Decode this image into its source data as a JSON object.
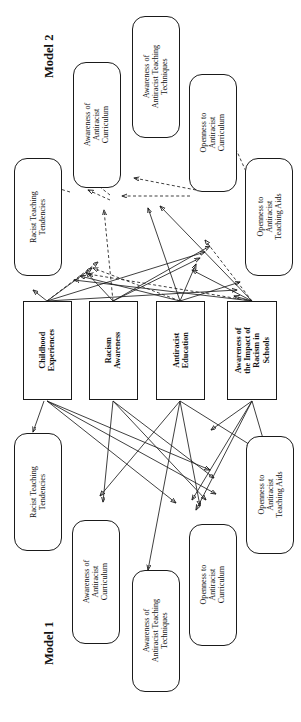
{
  "figure": {
    "type": "path-diagram",
    "orientation": "rotated-90-ccw",
    "model_titles": {
      "model2": "Model 2",
      "model1": "Model 1"
    }
  },
  "central_predictors": [
    {
      "id": "childhood",
      "label": "Childhood\nExperiences",
      "shape": "rectangle"
    },
    {
      "id": "racism_awareness",
      "label": "Racism\nAwareness",
      "shape": "rectangle"
    },
    {
      "id": "antiracist_education",
      "label": "Antiracist\nEducation",
      "shape": "rectangle"
    },
    {
      "id": "impact_awareness",
      "label": "Awareness of\nthe Impact of\nRacism in\nSchools",
      "shape": "rectangle"
    }
  ],
  "model2_nodes": [
    {
      "id": "m2_racist_tend",
      "label": "Racist Teaching\nTendencies",
      "shape": "rounded"
    },
    {
      "id": "m2_aware_curric",
      "label": "Awareness of\nAntiracist\nCurriculum",
      "shape": "rounded"
    },
    {
      "id": "m2_aware_tech",
      "label": "Awareness of\nAntiracist Teaching\nTechniques",
      "shape": "rounded"
    },
    {
      "id": "m2_open_curric",
      "label": "Openness to\nAntiracist\nCurriculum",
      "shape": "rounded"
    },
    {
      "id": "m2_open_aids",
      "label": "Openness to\nAntiracist\nTeaching Aids",
      "shape": "rounded"
    }
  ],
  "model1_nodes": [
    {
      "id": "m1_racist_tend",
      "label": "Racist Teaching\nTendencies",
      "shape": "rounded"
    },
    {
      "id": "m1_aware_curric",
      "label": "Awareness of\nAntiracist\nCurriculum",
      "shape": "rounded"
    },
    {
      "id": "m1_aware_tech",
      "label": "Awareness of\nAntiracist Teaching\nTechniques",
      "shape": "rounded"
    },
    {
      "id": "m1_open_curric",
      "label": "Openness to\nAntiracist\nCurriculum",
      "shape": "rounded"
    },
    {
      "id": "m1_open_aids",
      "label": "Openness to\nAntiracist\nTeaching Aids",
      "shape": "rounded"
    }
  ],
  "edge_styles": {
    "solid": "direct path",
    "dashed": "correlated / covariance path"
  },
  "colors": {
    "line": "#1d1d1d",
    "box_border": "#1a1a1a",
    "background": "#ffffff",
    "text": "#111111"
  }
}
